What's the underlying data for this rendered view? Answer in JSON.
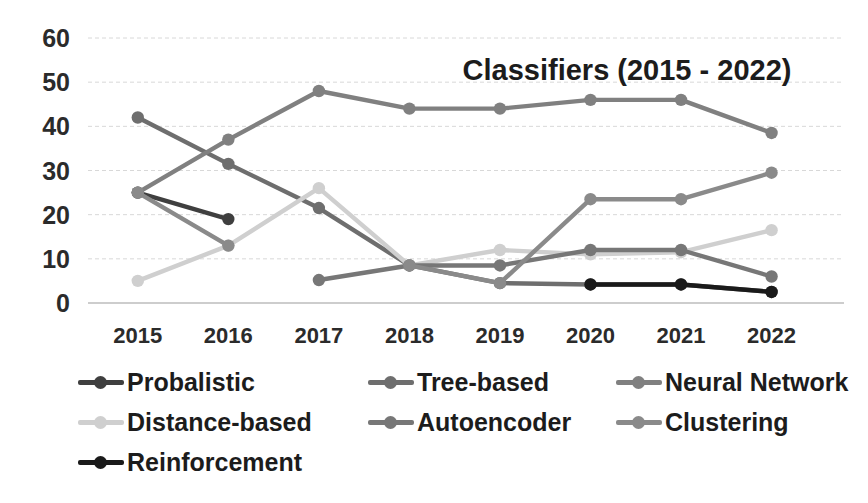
{
  "chart_data": {
    "type": "line",
    "title": "Classifiers (2015 - 2022)",
    "xlabel": "",
    "ylabel": "",
    "categories": [
      "2015",
      "2016",
      "2017",
      "2018",
      "2019",
      "2020",
      "2021",
      "2022"
    ],
    "ylim": [
      0,
      60
    ],
    "yticks": [
      0,
      10,
      20,
      30,
      40,
      50,
      60
    ],
    "grid": true,
    "legend_position": "bottom",
    "series": [
      {
        "name": "Probalistic",
        "color": "#3f3f3f",
        "values": [
          25,
          19,
          null,
          null,
          null,
          null,
          null,
          null
        ]
      },
      {
        "name": "Tree-based",
        "color": "#6e6e6e",
        "values": [
          42,
          31.5,
          21.5,
          8.5,
          4.5,
          4.2,
          4.2,
          2.5
        ]
      },
      {
        "name": "Neural Network",
        "color": "#808080",
        "values": [
          25,
          37,
          48,
          44,
          44,
          46,
          46,
          38.5
        ]
      },
      {
        "name": "Distance-based",
        "color": "#cfcfcf",
        "values": [
          5,
          13,
          26,
          8.5,
          12,
          11,
          11.5,
          16.5
        ]
      },
      {
        "name": "Autoencoder",
        "color": "#777777",
        "values": [
          null,
          null,
          5.2,
          8.5,
          8.5,
          12,
          12,
          6
        ]
      },
      {
        "name": "Clustering",
        "color": "#8a8a8a",
        "values": [
          25,
          13,
          null,
          8.5,
          4.5,
          23.5,
          23.5,
          29.5
        ]
      },
      {
        "name": "Reinforcement",
        "color": "#1a1a1a",
        "values": [
          null,
          null,
          null,
          null,
          null,
          4.2,
          4.2,
          2.5
        ]
      }
    ]
  },
  "legend": {
    "rows": [
      [
        "Probalistic",
        "Tree-based",
        "Neural Network"
      ],
      [
        "Distance-based",
        "Autoencoder",
        "Clustering"
      ],
      [
        "Reinforcement"
      ]
    ]
  }
}
